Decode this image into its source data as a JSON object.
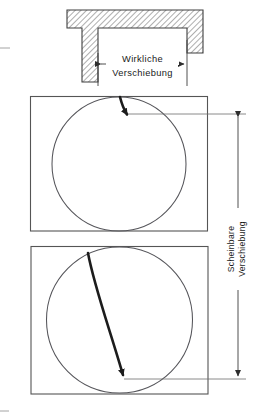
{
  "figure": {
    "name": "displacement-diagram",
    "background_color": "#ffffff",
    "ink_color": "#1a1a1a",
    "line_color": "#555555",
    "crack_color": "#1c1c1c",
    "hatch_color": "#3f3f3f"
  },
  "labels": {
    "true_displacement": {
      "line1": "Wirkliche",
      "line2": "Verschiebung",
      "orientation": "horizontal",
      "icon": "double-arrow-horizontal-icon"
    },
    "apparent_displacement": {
      "line1": "Scheinbare",
      "line2": "Verschiebung",
      "orientation": "vertical",
      "icon": "double-arrow-vertical-icon"
    }
  },
  "top_block": {
    "name": "hatched-fault-block",
    "description": "hatched-overhang-with-column",
    "fill_pattern": "diagonal-hatch"
  },
  "panels": [
    {
      "name": "upper-core-panel",
      "circle_label": "borehole-core-circle",
      "crack_label": "fracture-trace-short",
      "arrow": "arrowhead-down-right-icon"
    },
    {
      "name": "lower-core-panel",
      "circle_label": "borehole-core-circle",
      "crack_label": "fracture-trace-long",
      "arrow": "arrowhead-down-icon"
    }
  ],
  "dimensions": {
    "horizontal_span_label": "Wirkliche Verschiebung",
    "vertical_span_label": "Scheinbare Verschiebung"
  }
}
